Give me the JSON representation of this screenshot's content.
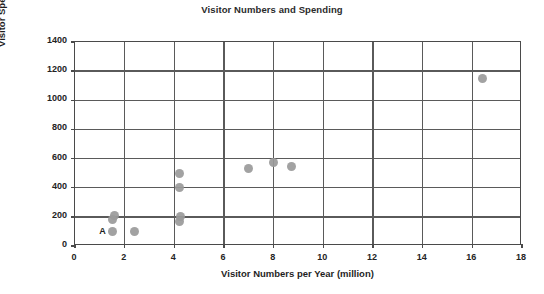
{
  "chart_data": {
    "type": "scatter",
    "title": "Visitor Numbers and Spending",
    "xlabel": "Visitor Numbers per Year (million)",
    "ylabel": "Visitor Spending (£m)",
    "xlim": [
      0,
      18
    ],
    "ylim": [
      0,
      1400
    ],
    "xticks": [
      0,
      2,
      4,
      6,
      8,
      10,
      12,
      14,
      16,
      18
    ],
    "yticks": [
      0,
      200,
      400,
      600,
      800,
      1000,
      1200,
      1400
    ],
    "xtick_labels": [
      "0",
      "2",
      "4",
      "6",
      "8",
      "10",
      "12",
      "14",
      "16",
      "18"
    ],
    "ytick_labels": [
      "0",
      "200",
      "400",
      "600",
      "800",
      "1000",
      "1200",
      "1400"
    ],
    "grid": true,
    "legend": null,
    "marker_color": "#9a9a9a",
    "points": [
      {
        "x": 1.5,
        "y": 180,
        "label": null
      },
      {
        "x": 1.6,
        "y": 210,
        "label": null
      },
      {
        "x": 1.5,
        "y": 100,
        "label": "A"
      },
      {
        "x": 2.4,
        "y": 100,
        "label": null
      },
      {
        "x": 4.2,
        "y": 170,
        "label": null
      },
      {
        "x": 4.25,
        "y": 205,
        "label": null
      },
      {
        "x": 4.2,
        "y": 400,
        "label": null
      },
      {
        "x": 4.2,
        "y": 500,
        "label": null
      },
      {
        "x": 7.0,
        "y": 535,
        "label": null
      },
      {
        "x": 8.0,
        "y": 575,
        "label": null
      },
      {
        "x": 8.7,
        "y": 545,
        "label": null
      },
      {
        "x": 16.4,
        "y": 1150,
        "label": null
      }
    ],
    "annotations": [
      {
        "text": "A",
        "x": 1.5,
        "y": 100,
        "note": "label placed left of point"
      }
    ]
  }
}
